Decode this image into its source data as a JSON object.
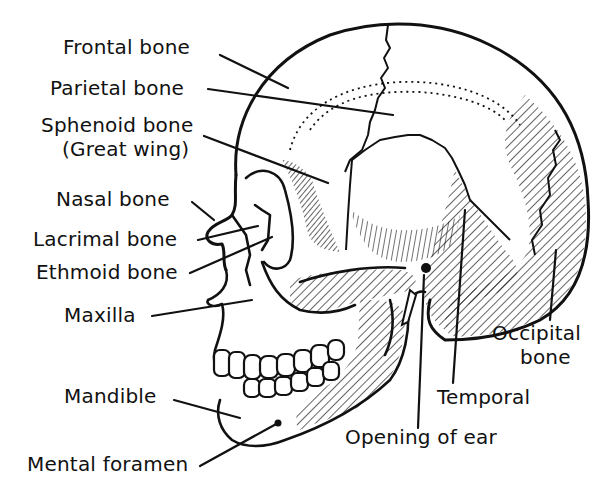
{
  "diagram": {
    "labels": {
      "frontal": "Frontal bone",
      "parietal": "Parietal bone",
      "sphenoid_1": "Sphenoid bone",
      "sphenoid_2": "(Great wing)",
      "nasal": "Nasal bone",
      "lacrimal": "Lacrimal bone",
      "ethmoid": "Ethmoid bone",
      "maxilla": "Maxilla",
      "mandible": "Mandible",
      "mental_foramen": "Mental foramen",
      "opening_of_ear": "Opening of ear",
      "temporal": "Temporal",
      "occipital_1": "Occipital",
      "occipital_2": "bone"
    },
    "colors": {
      "ink": "#111111",
      "background": "#ffffff"
    }
  }
}
